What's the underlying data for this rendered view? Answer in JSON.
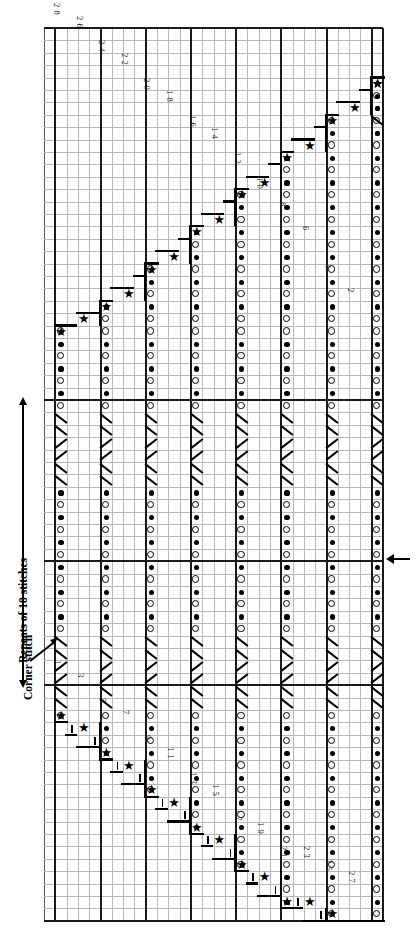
{
  "document": {
    "kind": "knitting-lace-chart",
    "orientation": "rotated-90-clockwise",
    "title": ""
  },
  "annotations": {
    "repeat_label": "Repeats of 18 stitches",
    "corner_label": "Corner stitch",
    "start_arrow": "start-row-arrow"
  },
  "grid": {
    "columns": 30,
    "rows": 72,
    "cell_w": 11.3,
    "cell_h": 12.4,
    "heavy_columns": [
      1,
      5,
      9,
      13,
      17,
      21,
      25,
      29,
      30
    ],
    "heavy_rows": [
      0,
      30,
      43,
      53,
      72
    ],
    "grid_color": "#b9b9b9",
    "heavy_color": "#1a1a1a"
  },
  "symbols": {
    "dot": "purl",
    "ring": "yarn-over",
    "slash": "k2tog",
    "bslash": "ssk",
    "star": "nupp",
    "bar": "tick"
  },
  "row_numbers": {
    "even": [
      "2",
      "4",
      "6",
      "8",
      "10",
      "12",
      "14",
      "16",
      "18",
      "20",
      "22",
      "24",
      "26",
      "28"
    ],
    "odd": [
      "1",
      "3",
      "5",
      "7",
      "9",
      "11",
      "13",
      "15",
      "17",
      "19",
      "21",
      "23",
      "25",
      "27"
    ]
  },
  "chart_data": {
    "type": "heatmap",
    "xlabel": "stitches",
    "ylabel": "rows",
    "grid": true,
    "legend": [
      "purl = filled dot",
      "yarn-over = open circle",
      "k2tog = /",
      "ssk = \\",
      "nupp = star"
    ],
    "columns": 30,
    "rows": 72,
    "symbol_columns": [
      1,
      5,
      9,
      13,
      17,
      21,
      25,
      29
    ],
    "even_row_labels": [
      2,
      4,
      6,
      8,
      10,
      12,
      14,
      16,
      18,
      20,
      22,
      24,
      26,
      28
    ],
    "odd_row_labels": [
      1,
      3,
      5,
      7,
      9,
      11,
      13,
      15,
      17,
      19,
      21,
      23,
      25,
      27
    ],
    "repeat_span_rows": [
      30,
      53
    ],
    "note": "Stepped diagonal increase boundary runs from lower-left to upper-right on each half"
  }
}
